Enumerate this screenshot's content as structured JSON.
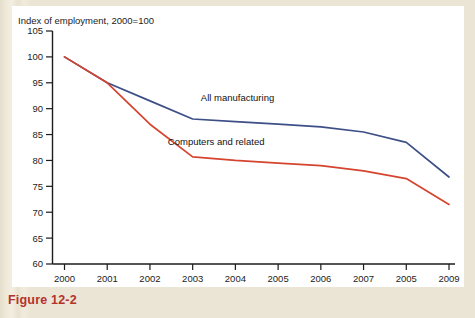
{
  "figure": {
    "caption": "Figure 12-2"
  },
  "chart_data": {
    "type": "line",
    "title": "Index of employment, 2000=100",
    "xlabel": "",
    "ylabel": "",
    "ylim": [
      60,
      105
    ],
    "yticks": [
      60,
      65,
      70,
      75,
      80,
      85,
      90,
      95,
      100,
      105
    ],
    "ytick_labels": [
      "60",
      "65",
      "70",
      "75",
      "80",
      "85",
      "90",
      "95",
      "100",
      "105"
    ],
    "grid": false,
    "legend_position": "inline-annotation",
    "categories": [
      2000,
      2001,
      2002,
      2003,
      2004,
      2005,
      2006,
      2007,
      2008,
      2009
    ],
    "xtick_labels": [
      "2000",
      "2001",
      "2002",
      "2003",
      "2004",
      "2005",
      "2006",
      "2007",
      "2005",
      "2009"
    ],
    "series": [
      {
        "name": "All manufacturing",
        "color": "#3d4f86",
        "values": [
          100,
          95,
          91.5,
          88,
          87.5,
          87,
          86.5,
          85.5,
          83.5,
          76.8
        ],
        "label_x": 2004.05,
        "label_y": 91.4
      },
      {
        "name": "Computers and related",
        "color": "#d4442f",
        "values": [
          100,
          95,
          87,
          80.7,
          80,
          79.5,
          79,
          78,
          76.5,
          71.5
        ],
        "label_x": 2003.55,
        "label_y": 82.9
      }
    ]
  }
}
